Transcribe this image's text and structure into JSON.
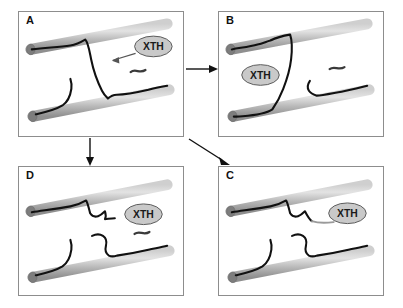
{
  "figure": {
    "background_color": "#ffffff",
    "panel_border_color": "#8d8d8d"
  },
  "colors": {
    "microfibril_light": "#d8d8d8",
    "microfibril_mid": "#b4b4b4",
    "microfibril_dark": "#8a8a8a",
    "microfibril_cap": "#7d7d7d",
    "xyloglucan_chain": "#111111",
    "xth_oval_fill": "#c9c9c9",
    "xth_oval_stroke": "#5a5a5a",
    "xth_label_color": "#1a1a1a",
    "arrow_color": "#111111",
    "pointer_arrow_color": "#555555",
    "cut_chain_gray": "#9a9a9a"
  },
  "panels": [
    {
      "id": "A",
      "letter": "A",
      "xth_label": "XTH",
      "xth_position": "upper-right",
      "description": "Intact xyloglucan tether spanning two cellulose microfibrils; XTH enzyme approaches the cross-link",
      "has_pointer_arrow": true,
      "has_free_oligosaccharide": true
    },
    {
      "id": "B",
      "letter": "B",
      "xth_label": "XTH",
      "xth_position": "center-left",
      "description": "XTH bound at the tether; the xyloglucan cross-link is shortened and repositioned",
      "has_pointer_arrow": false,
      "has_free_oligosaccharide": true
    },
    {
      "id": "C",
      "letter": "C",
      "xth_label": "XTH",
      "xth_position": "center-right",
      "description": "Tether severed; cut chain end released next to XTH, microfibrils no longer cross-linked",
      "has_pointer_arrow": false,
      "has_free_oligosaccharide": false
    },
    {
      "id": "D",
      "letter": "D",
      "xth_label": "XTH",
      "xth_position": "upper-right",
      "description": "Cross-link fully resolved; separate xyloglucan chains remain bound to each microfibril",
      "has_pointer_arrow": false,
      "has_free_oligosaccharide": true
    }
  ],
  "connectors": [
    {
      "id": "a-to-b",
      "from": "A",
      "to": "B",
      "direction": "right",
      "style": "solid-arrow"
    },
    {
      "id": "a-to-d",
      "from": "A",
      "to": "D",
      "direction": "down",
      "style": "solid-arrow"
    },
    {
      "id": "a-to-c",
      "from": "A",
      "to": "C",
      "direction": "down-right",
      "style": "solid-arrow"
    }
  ],
  "legend": {
    "microfibril_name": "cellulose microfibril",
    "chain_name": "xyloglucan chain",
    "enzyme_name": "XTH",
    "oligosaccharide_name": "xyloglucan oligosaccharide"
  }
}
